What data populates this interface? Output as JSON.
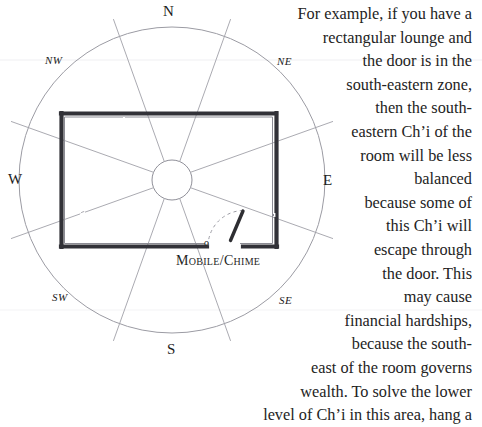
{
  "figure": {
    "type": "feng-shui-compass-room-diagram",
    "title_visible": false,
    "compass": {
      "cardinal_labels": [
        {
          "id": "N",
          "label": "N"
        },
        {
          "id": "E",
          "label": "E"
        },
        {
          "id": "S",
          "label": "S"
        },
        {
          "id": "W",
          "label": "W"
        }
      ],
      "intercardinal_labels": [
        {
          "id": "NW",
          "label": "NW"
        },
        {
          "id": "NE",
          "label": "NE"
        },
        {
          "id": "SW",
          "label": "SW"
        },
        {
          "id": "SE",
          "label": "SE"
        }
      ],
      "sector_count": 8,
      "outer_circle": {
        "cx": 172,
        "cy": 180,
        "r": 153
      },
      "inner_circle": {
        "cx": 172,
        "cy": 180,
        "r": 20
      }
    },
    "room": {
      "shape": "rectangle",
      "x": 60,
      "y": 112,
      "width": 217,
      "height": 136,
      "door": {
        "label": "Mobile/Chime",
        "marker": "o",
        "zone": "SE",
        "swing": "dashed-arc"
      }
    },
    "colors": {
      "background": "#ffffff",
      "ink": "#232323",
      "compass_line": "#9a9aa2",
      "wall": "#3a3a3a",
      "wall_shadow": "#7d7d85"
    }
  },
  "prose": {
    "lines": [
      "For example, if you have a",
      "rectangular lounge and",
      "the door is in the",
      "south-eastern zone,",
      "then the south-",
      "eastern Ch’i of the",
      "room will be less",
      "balanced",
      "because some of",
      "this Ch’i will",
      "escape through",
      "the door. This",
      "may cause",
      "financial hardships,",
      "because the south-",
      "east of the room governs",
      "wealth. To solve the lower",
      "level of Ch’i in this area, hang a"
    ]
  }
}
